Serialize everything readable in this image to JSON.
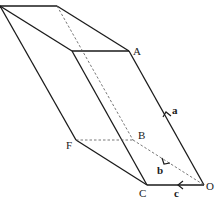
{
  "diagram": {
    "type": "parallelepiped",
    "vertex_labels": {
      "A": "A",
      "B": "B",
      "C": "C",
      "F": "F",
      "O": "O"
    },
    "vector_labels": {
      "a": "a",
      "b": "b",
      "c": "c"
    },
    "colors": {
      "line": "#1a1a1a",
      "hidden_line": "#555555",
      "background": "#ffffff"
    }
  }
}
